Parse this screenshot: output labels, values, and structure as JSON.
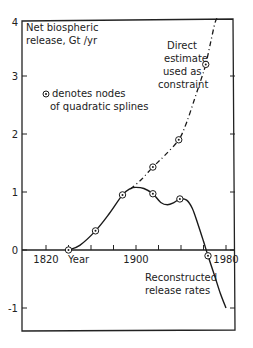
{
  "chart_data": {
    "type": "line",
    "title": "",
    "ylabel_line1": "Net biospheric",
    "ylabel_line2": "release, Gt /yr",
    "xlabel": "Year",
    "xlim": [
      1800,
      1990
    ],
    "ylim": [
      -1.35,
      4
    ],
    "x_ticks": [
      1820,
      1840,
      1860,
      1880,
      1900,
      1920,
      1940,
      1960,
      1980
    ],
    "x_tick_labels": {
      "1820": "1820",
      "1900": "1900",
      "1980": "1980"
    },
    "y_ticks": [
      -1,
      0,
      1,
      2,
      3,
      4
    ],
    "y_tick_labels": [
      "-1",
      "0",
      "1",
      "2",
      "3",
      "4"
    ],
    "grid": false,
    "legend_note_line1": "denotes nodes",
    "legend_note_line2": "of quadratic splines",
    "annotations": {
      "direct_estimate": [
        "Direct",
        "estimate",
        "used as",
        "constraint"
      ],
      "reconstructed": [
        "Reconstructed",
        "release rates"
      ]
    },
    "series": [
      {
        "name": "Reconstructed release rates",
        "style": "solid",
        "curve": [
          [
            1840,
            0.0
          ],
          [
            1850,
            0.08
          ],
          [
            1864,
            0.33
          ],
          [
            1876,
            0.62
          ],
          [
            1888,
            0.95
          ],
          [
            1895,
            1.06
          ],
          [
            1900,
            1.08
          ],
          [
            1907,
            1.06
          ],
          [
            1915,
            0.97
          ],
          [
            1922,
            0.82
          ],
          [
            1928,
            0.78
          ],
          [
            1934,
            0.82
          ],
          [
            1939,
            0.88
          ],
          [
            1945,
            0.86
          ],
          [
            1950,
            0.72
          ],
          [
            1955,
            0.45
          ],
          [
            1960,
            0.15
          ],
          [
            1964,
            -0.1
          ],
          [
            1970,
            -0.45
          ],
          [
            1975,
            -0.75
          ],
          [
            1980,
            -1.0
          ]
        ],
        "nodes": [
          [
            1840,
            0.0
          ],
          [
            1864,
            0.33
          ],
          [
            1888,
            0.95
          ],
          [
            1915,
            0.97
          ],
          [
            1939,
            0.88
          ],
          [
            1964,
            -0.1
          ]
        ]
      },
      {
        "name": "Direct estimate used as constraint",
        "style": "dash-dot",
        "curve": [
          [
            1895,
            1.05
          ],
          [
            1905,
            1.22
          ],
          [
            1915,
            1.43
          ],
          [
            1925,
            1.62
          ],
          [
            1938,
            1.9
          ],
          [
            1945,
            2.2
          ],
          [
            1952,
            2.6
          ],
          [
            1958,
            2.95
          ],
          [
            1962,
            3.2
          ],
          [
            1966,
            3.55
          ],
          [
            1970,
            3.9
          ],
          [
            1972,
            4.0
          ]
        ],
        "nodes": [
          [
            1915,
            1.43
          ],
          [
            1938,
            1.9
          ],
          [
            1962,
            3.2
          ]
        ]
      }
    ]
  }
}
